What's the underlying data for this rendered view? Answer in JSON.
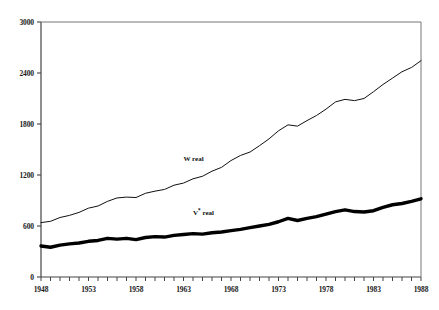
{
  "chart_data": {
    "type": "line",
    "title": "",
    "xlabel": "",
    "ylabel": "",
    "xlim": [
      1948,
      1988
    ],
    "ylim": [
      0,
      3000
    ],
    "grid": false,
    "legend_position": "inline-annotation",
    "y_ticks": [
      0,
      600,
      1200,
      1800,
      2400,
      3000
    ],
    "y_tick_labels": [
      "0",
      "600",
      "1200",
      "1800",
      "2400",
      "3000"
    ],
    "x_ticks": [
      1948,
      1949,
      1950,
      1951,
      1952,
      1953,
      1954,
      1955,
      1956,
      1957,
      1958,
      1959,
      1960,
      1961,
      1962,
      1963,
      1964,
      1965,
      1966,
      1967,
      1968,
      1969,
      1970,
      1971,
      1972,
      1973,
      1974,
      1975,
      1976,
      1977,
      1978,
      1979,
      1980,
      1981,
      1982,
      1983,
      1984,
      1985,
      1986,
      1987,
      1988
    ],
    "x_tick_labels": [
      "1948",
      "1953",
      "1958",
      "1963",
      "1968",
      "1973",
      "1978",
      "1983",
      "1988"
    ],
    "x_labeled_ticks": [
      1948,
      1953,
      1958,
      1963,
      1968,
      1973,
      1978,
      1983,
      1988
    ],
    "x": [
      1948,
      1949,
      1950,
      1951,
      1952,
      1953,
      1954,
      1955,
      1956,
      1957,
      1958,
      1959,
      1960,
      1961,
      1962,
      1963,
      1964,
      1965,
      1966,
      1967,
      1968,
      1969,
      1970,
      1971,
      1972,
      1973,
      1974,
      1975,
      1976,
      1977,
      1978,
      1979,
      1980,
      1981,
      1982,
      1983,
      1984,
      1985,
      1986,
      1987,
      1988
    ],
    "series": [
      {
        "name": "W real",
        "style": "thin",
        "color": "#111111",
        "label_x": 1963,
        "label_y": 1430,
        "values": [
          640,
          655,
          700,
          725,
          760,
          810,
          835,
          890,
          930,
          940,
          935,
          985,
          1010,
          1030,
          1080,
          1105,
          1155,
          1185,
          1245,
          1290,
          1370,
          1430,
          1470,
          1545,
          1625,
          1720,
          1790,
          1775,
          1840,
          1900,
          1975,
          2060,
          2090,
          2075,
          2100,
          2180,
          2265,
          2340,
          2415,
          2465,
          2545
        ]
      },
      {
        "name": "V* real",
        "name_base": "V",
        "name_sup": "*",
        "name_suffix": " real",
        "style": "thick",
        "color": "#000000",
        "label_x": 1964,
        "label_y": 800,
        "values": [
          365,
          350,
          375,
          390,
          400,
          420,
          430,
          455,
          445,
          455,
          440,
          465,
          475,
          470,
          490,
          500,
          510,
          505,
          520,
          530,
          545,
          560,
          580,
          600,
          620,
          650,
          690,
          665,
          690,
          710,
          740,
          770,
          790,
          770,
          765,
          780,
          820,
          850,
          865,
          890,
          920
        ]
      }
    ]
  },
  "axes": {
    "plot_left": 41,
    "plot_right": 421,
    "plot_top": 22,
    "plot_bottom": 277
  }
}
